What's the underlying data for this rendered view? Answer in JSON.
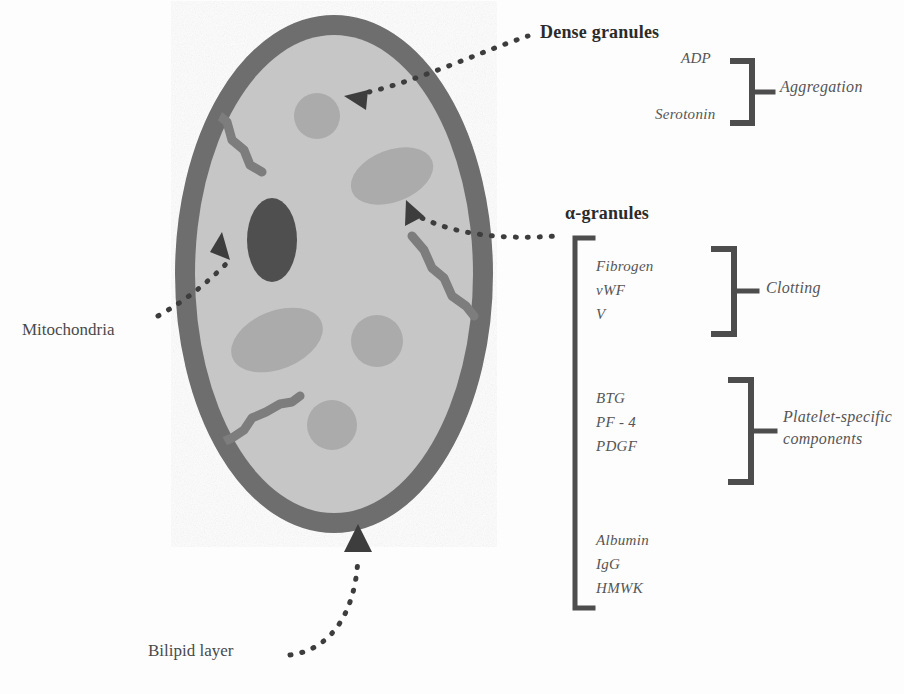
{
  "diagram": {
    "type": "cell-diagram",
    "colors": {
      "membrane": "#6e6e6e",
      "cytoplasm": "#c2c2c2",
      "granule": "#a8a8a8",
      "mitochondria": "#555555",
      "canaliculi": "#7d7d7d",
      "text": "#3a3a3a",
      "bracket": "#4d4d4d",
      "background": "#ffffff"
    }
  },
  "cell": {
    "structures": [
      {
        "name": "bilipid-membrane",
        "shape": "ellipse-ring"
      },
      {
        "name": "cytoplasm",
        "shape": "ellipse"
      },
      {
        "name": "alpha-granule",
        "shape": "circle"
      },
      {
        "name": "alpha-granule",
        "shape": "ellipse"
      },
      {
        "name": "dense-granule",
        "shape": "circle"
      },
      {
        "name": "mitochondrion",
        "shape": "ellipse-dark"
      },
      {
        "name": "open-canalicular-channel",
        "shape": "squiggle"
      }
    ]
  },
  "callouts": {
    "dense_granules": "Dense granules",
    "alpha_granules": "α-granules",
    "mitochondria": "Mitochondria",
    "bilipid_layer": "Bilipid layer"
  },
  "dense_granule_contents": {
    "items": [
      "ADP",
      "Serotonin"
    ],
    "function": "Aggregation"
  },
  "alpha_granule_contents": {
    "groups": [
      {
        "items": [
          "Fibrogen",
          "vWF",
          "V"
        ],
        "function": "Clotting"
      },
      {
        "items": [
          "BTG",
          "PF - 4",
          "PDGF"
        ],
        "function_line1": "Platelet-specific",
        "function_line2": "components"
      },
      {
        "items": [
          "Albumin",
          "IgG",
          "HMWK"
        ],
        "function": ""
      }
    ]
  }
}
